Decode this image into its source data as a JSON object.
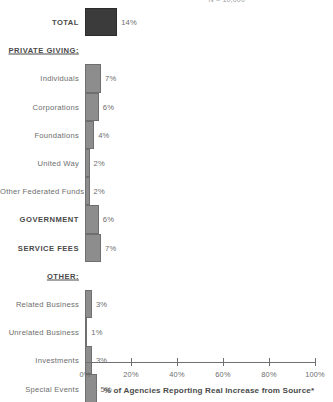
{
  "top_note": "N = 10,000",
  "chart_data": {
    "type": "bar",
    "orientation": "horizontal",
    "title": "",
    "xlabel": "% of Agencies Reporting Real Increase from Source*",
    "ylabel": "",
    "xlim": [
      0,
      100
    ],
    "grid": false,
    "legend": "none",
    "tick_labels": [
      "0%",
      "20%",
      "40%",
      "60%",
      "80%",
      "100%"
    ],
    "tick_values": [
      0,
      20,
      40,
      60,
      80,
      100
    ],
    "categories": [
      "TOTAL",
      "PRIVATE GIVING:",
      "Individuals",
      "Corporations",
      "Foundations",
      "United Way",
      "Other Federated Funds",
      "GOVERNMENT",
      "SERVICE FEES",
      "OTHER:",
      "Related Business",
      "Unrelated Business",
      "Investments",
      "Special Events"
    ],
    "values": [
      14,
      null,
      7,
      6,
      4,
      2,
      2,
      6,
      7,
      null,
      3,
      1,
      3,
      5
    ],
    "value_labels": [
      "14%",
      "",
      "7%",
      "6%",
      "4%",
      "2%",
      "2%",
      "6%",
      "7%",
      "",
      "3%",
      "1%",
      "3%",
      "5%"
    ],
    "rows": [
      {
        "label": "TOTAL",
        "value": 14,
        "value_label": "14%",
        "style": "bold",
        "bar": "total"
      },
      {
        "label": "PRIVATE GIVING:",
        "value": null,
        "value_label": "",
        "style": "heading",
        "bar": "none"
      },
      {
        "label": "Individuals",
        "value": 7,
        "value_label": "7%",
        "style": "normal",
        "bar": "plain"
      },
      {
        "label": "Corporations",
        "value": 6,
        "value_label": "6%",
        "style": "normal",
        "bar": "plain"
      },
      {
        "label": "Foundations",
        "value": 4,
        "value_label": "4%",
        "style": "normal",
        "bar": "plain"
      },
      {
        "label": "United Way",
        "value": 2,
        "value_label": "2%",
        "style": "normal",
        "bar": "plain"
      },
      {
        "label": "Other Federated Funds",
        "value": 2,
        "value_label": "2%",
        "style": "normal",
        "bar": "plain"
      },
      {
        "label": "GOVERNMENT",
        "value": 6,
        "value_label": "6%",
        "style": "bold",
        "bar": "plain"
      },
      {
        "label": "SERVICE FEES",
        "value": 7,
        "value_label": "7%",
        "style": "bold",
        "bar": "plain"
      },
      {
        "label": "OTHER:",
        "value": null,
        "value_label": "",
        "style": "heading",
        "bar": "none"
      },
      {
        "label": "Related Business",
        "value": 3,
        "value_label": "3%",
        "style": "normal",
        "bar": "plain"
      },
      {
        "label": "Unrelated Business",
        "value": 1,
        "value_label": "1%",
        "style": "normal",
        "bar": "plain"
      },
      {
        "label": "Investments",
        "value": 3,
        "value_label": "3%",
        "style": "normal",
        "bar": "plain"
      },
      {
        "label": "Special Events",
        "value": 5,
        "value_label": "5%",
        "style": "normal",
        "bar": "plain"
      }
    ],
    "colors": {
      "total_bar": "#3b3b3b",
      "bar": "#8d8d8d",
      "bar_border": "#6f6f6f",
      "axis": "#707070",
      "text": "#6d6d6d",
      "background": "#ffffff"
    }
  }
}
